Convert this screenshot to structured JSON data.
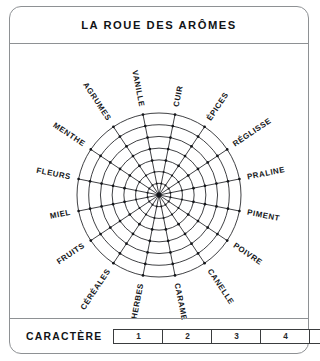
{
  "card": {
    "title": "LA ROUE DES ARÔMES"
  },
  "footer": {
    "label": "CARACTÈRE",
    "scale": [
      "1",
      "2",
      "3",
      "4",
      "5"
    ]
  },
  "wheel": {
    "center_x": 149,
    "center_y": 151,
    "radius": 82,
    "rings": 7,
    "spokes": 16,
    "label_radius": 90,
    "colors": {
      "line": "#1d1f22",
      "node": "#14161a",
      "frame": "#8e9194",
      "text": "#16181b"
    },
    "labels": [
      "CUIR",
      "ÉPICES",
      "RÉGLISSE",
      "PRALINE",
      "PIMENT",
      "POIVRE",
      "CANELLE",
      "CARAMEL",
      "HERBES",
      "CÉRÉALES",
      "FRUITS",
      "MIEL",
      "FLEURS",
      "MENTHE",
      "AGRUMES",
      "VANILLE"
    ]
  }
}
